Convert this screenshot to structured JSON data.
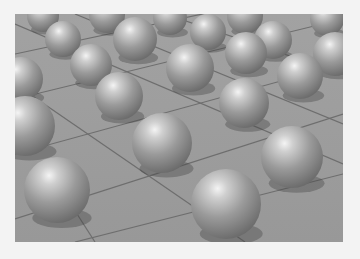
{
  "scene": {
    "description": "3D render of grey spheres resting on a tiled grid floor",
    "colors": {
      "border": "#f3f3f3",
      "floor": "#9c9c9c",
      "grid_line": "#6e6e6e",
      "sphere_base": "#8e8e8e",
      "sphere_highlight": "#f4f4f4"
    },
    "spheres": [
      {
        "cx": 28,
        "cy": 2,
        "r": 16
      },
      {
        "cx": 92,
        "cy": 1,
        "r": 18
      },
      {
        "cx": 155,
        "cy": 4,
        "r": 17
      },
      {
        "cx": 230,
        "cy": 2,
        "r": 18
      },
      {
        "cx": 312,
        "cy": 5,
        "r": 17
      },
      {
        "cx": 48,
        "cy": 25,
        "r": 18
      },
      {
        "cx": 120,
        "cy": 25,
        "r": 22
      },
      {
        "cx": 193,
        "cy": 18,
        "r": 18
      },
      {
        "cx": 258,
        "cy": 26,
        "r": 19
      },
      {
        "cx": 320,
        "cy": 40,
        "r": 22
      },
      {
        "cx": 6,
        "cy": 65,
        "r": 22
      },
      {
        "cx": 76,
        "cy": 51,
        "r": 21
      },
      {
        "cx": 175,
        "cy": 54,
        "r": 24
      },
      {
        "cx": 231,
        "cy": 39,
        "r": 21
      },
      {
        "cx": 285,
        "cy": 62,
        "r": 23
      },
      {
        "cx": 104,
        "cy": 82,
        "r": 24
      },
      {
        "cx": 229,
        "cy": 89,
        "r": 25
      },
      {
        "cx": 10,
        "cy": 112,
        "r": 30
      },
      {
        "cx": 147,
        "cy": 129,
        "r": 30
      },
      {
        "cx": 277,
        "cy": 143,
        "r": 31
      },
      {
        "cx": 42,
        "cy": 176,
        "r": 33
      },
      {
        "cx": 211,
        "cy": 190,
        "r": 35
      }
    ],
    "grid_lines": [
      {
        "x1": 0,
        "y1": 40,
        "x2": 328,
        "y2": -30
      },
      {
        "x1": 0,
        "y1": 85,
        "x2": 328,
        "y2": 5
      },
      {
        "x1": 0,
        "y1": 140,
        "x2": 328,
        "y2": 50
      },
      {
        "x1": 0,
        "y1": 205,
        "x2": 328,
        "y2": 100
      },
      {
        "x1": 60,
        "y1": 228,
        "x2": 328,
        "y2": 160
      },
      {
        "x1": 0,
        "y1": 10,
        "x2": 328,
        "y2": 150
      },
      {
        "x1": 60,
        "y1": 0,
        "x2": 328,
        "y2": 110
      },
      {
        "x1": 150,
        "y1": 0,
        "x2": 328,
        "y2": 60
      },
      {
        "x1": 0,
        "y1": 70,
        "x2": 230,
        "y2": 228
      },
      {
        "x1": 30,
        "y1": 150,
        "x2": 80,
        "y2": 228
      }
    ]
  }
}
